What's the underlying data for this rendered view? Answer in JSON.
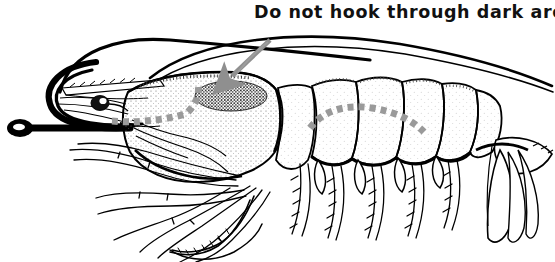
{
  "figure": {
    "background_color": "#ffffff",
    "width": 555,
    "height": 262
  },
  "caption": {
    "text": "Do not hook through dark area",
    "color": "#111111"
  },
  "annotations": {
    "arrow": {
      "name": "pointer-arrow",
      "color": "#8f8f8f",
      "description": "Gray arrow pointing from caption down-left to the dark area on the carapace",
      "from_x": 270,
      "from_y": 40,
      "to_x": 229,
      "to_y": 78
    },
    "dark_area": {
      "name": "dark-area-oval",
      "color": "#2b2b2b",
      "description": "Stippled dark oval region on the carapace (hepatopancreas) that must not be hooked",
      "center_x": 231,
      "center_y": 96,
      "radius_x": 36,
      "radius_y": 15
    },
    "dashed_paths": [
      {
        "name": "head-hook-path",
        "color": "#9a9a9a",
        "description": "Dashed line showing safe hook path through the head / forward body"
      },
      {
        "name": "tail-hook-path",
        "color": "#9a9a9a",
        "description": "Dashed arc showing safe hook path across the abdominal segments"
      }
    ]
  },
  "anatomy": {
    "label_note": "Not labeled in the image; parts listed for semantics only",
    "parts": [
      "antennae",
      "rostrum",
      "eye",
      "carapace",
      "dark-area",
      "abdominal-segments",
      "pereiopods",
      "pleopods",
      "uropods",
      "telson"
    ]
  },
  "colors": {
    "ink": "#000000",
    "paper": "#ffffff",
    "gray_accent": "#9a9a9a",
    "stipple": "#555555"
  }
}
